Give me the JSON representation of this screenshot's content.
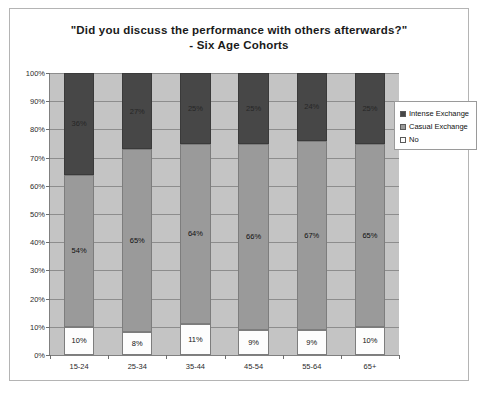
{
  "chart_data": {
    "type": "bar",
    "subtype": "stacked-100-percent",
    "title": "\"Did you discuss the performance with others afterwards?\"",
    "subtitle": "- Six Age Cohorts",
    "xlabel": "",
    "ylabel": "",
    "categories": [
      "15-24",
      "25-34",
      "35-44",
      "45-54",
      "55-64",
      "65+"
    ],
    "series": [
      {
        "name": "No",
        "color": "#fdfdfd",
        "values": [
          10,
          8,
          11,
          9,
          9,
          10
        ],
        "labels": [
          "10%",
          "8%",
          "11%",
          "9%",
          "9%",
          "10%"
        ]
      },
      {
        "name": "Casual Exchange",
        "color": "#9a9a9a",
        "values": [
          54,
          65,
          64,
          66,
          67,
          65
        ],
        "labels": [
          "54%",
          "65%",
          "64%",
          "66%",
          "67%",
          "65%"
        ]
      },
      {
        "name": "Intense Exchange",
        "color": "#474747",
        "values": [
          36,
          27,
          25,
          25,
          24,
          25
        ],
        "labels": [
          "36%",
          "27%",
          "25%",
          "25%",
          "24%",
          "25%"
        ]
      }
    ],
    "ylim": [
      0,
      100
    ],
    "yticks": [
      0,
      10,
      20,
      30,
      40,
      50,
      60,
      70,
      80,
      90,
      100
    ],
    "ytick_labels": [
      "0%",
      "10%",
      "20%",
      "30%",
      "40%",
      "50%",
      "60%",
      "70%",
      "80%",
      "90%",
      "100%"
    ],
    "grid": true,
    "legend_position": "right",
    "legend_entries": [
      "Intense Exchange",
      "Casual Exchange",
      "No"
    ],
    "plot_background": "#c4c4c4"
  }
}
